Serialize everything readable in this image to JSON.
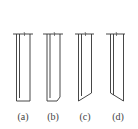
{
  "figure": {
    "panels": [
      {
        "id": "a",
        "label": "(a)",
        "tip": "flat"
      },
      {
        "id": "b",
        "label": "(b)",
        "tip": "chamfered corner"
      },
      {
        "id": "c",
        "label": "(c)",
        "tip": "bevel rising to right"
      },
      {
        "id": "d",
        "label": "(d)",
        "tip": "bevel rising to left"
      }
    ]
  },
  "colors": {
    "stroke": "#333333",
    "background": "#ffffff"
  }
}
